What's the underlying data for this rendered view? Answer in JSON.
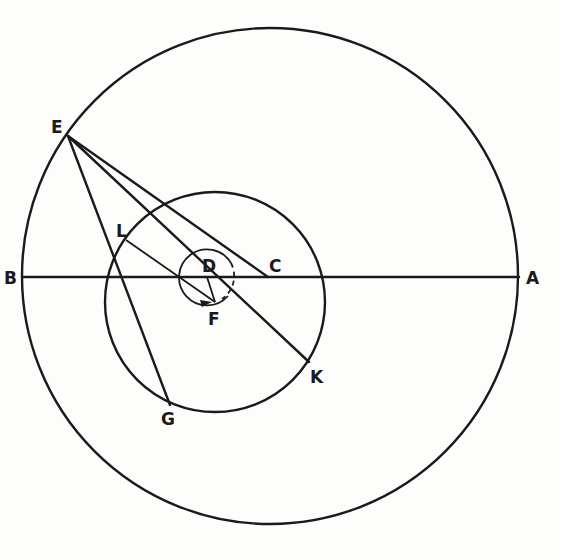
{
  "diagram": {
    "type": "geometric-construction",
    "colors": {
      "ink": "#1a1a1a",
      "paper": "#fdfdfb"
    },
    "labels": {
      "A": "A",
      "B": "B",
      "C": "C",
      "D": "D",
      "E": "E",
      "F": "F",
      "G": "G",
      "K": "K",
      "L": "L"
    },
    "circles": [
      {
        "name": "outer-circle",
        "cx": 270,
        "cy": 276,
        "r": 248
      },
      {
        "name": "inner-circle",
        "cx": 215,
        "cy": 302,
        "r": 110
      },
      {
        "name": "small-circle-about-D",
        "cx": 207,
        "cy": 277,
        "r": 28
      }
    ],
    "points": {
      "A": [
        519,
        277
      ],
      "B": [
        22,
        277
      ],
      "C": [
        268,
        277
      ],
      "D": [
        207,
        277
      ],
      "E": [
        68,
        136
      ],
      "F": [
        215,
        302
      ],
      "G": [
        170,
        405
      ],
      "K": [
        309,
        362
      ],
      "L": [
        126,
        240
      ]
    },
    "segments": [
      "B-A",
      "E-C",
      "E-K",
      "E-G",
      "L-F",
      "D-F"
    ]
  }
}
